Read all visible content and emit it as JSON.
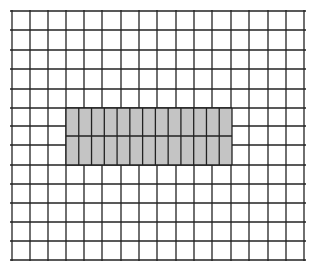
{
  "diagram": {
    "background": "#ffffff",
    "line_color": "#222222",
    "shade_color": "#c4c4c4",
    "grid": {
      "x_lines": [
        12,
        30,
        48,
        66,
        84,
        102,
        121,
        139,
        157,
        176,
        194,
        212,
        231,
        249,
        268,
        286,
        304
      ],
      "y_lines": [
        11,
        30,
        50,
        69,
        89,
        108,
        126,
        145,
        165,
        184,
        203,
        222,
        241,
        260
      ],
      "left": 10,
      "right": 306,
      "top": 10,
      "bottom": 261
    },
    "shaded_region": {
      "x": 66,
      "y": 108,
      "width": 166,
      "height": 57,
      "sub_columns": 13,
      "middle_line_y": 136
    }
  }
}
